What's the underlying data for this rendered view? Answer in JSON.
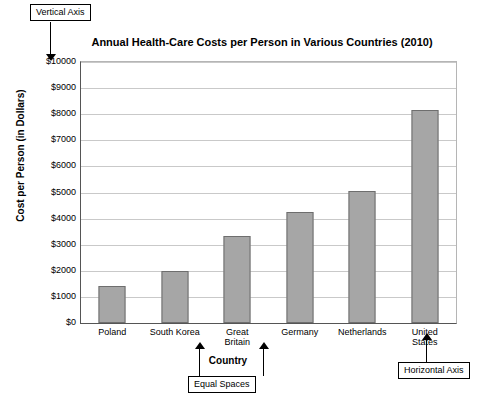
{
  "annotations": {
    "vertical_axis": "Vertical Axis",
    "horizontal_axis": "Horizontal Axis",
    "equal_spaces": "Equal Spaces"
  },
  "chart_data": {
    "type": "bar",
    "title": "Annual Health-Care Costs per Person in Various Countries (2010)",
    "xlabel": "Country",
    "ylabel": "Cost per Person (in Dollars)",
    "categories": [
      "Poland",
      "South Korea",
      "Great Britain",
      "Germany",
      "Netherlands",
      "United States"
    ],
    "category_lines": [
      [
        "Poland"
      ],
      [
        "South Korea"
      ],
      [
        "Great",
        "Britain"
      ],
      [
        "Germany"
      ],
      [
        "Netherlands"
      ],
      [
        "United",
        "States"
      ]
    ],
    "values": [
      1400,
      2000,
      3350,
      4250,
      5050,
      8150
    ],
    "ylim": [
      0,
      10000
    ],
    "yticks": [
      0,
      1000,
      2000,
      3000,
      4000,
      5000,
      6000,
      7000,
      8000,
      9000,
      10000
    ],
    "ytick_labels": [
      "$0",
      "$1000",
      "$2000",
      "$3000",
      "$4000",
      "$5000",
      "$6000",
      "$7000",
      "$8000",
      "$9000",
      "$10000"
    ],
    "grid": true,
    "legend": null,
    "bar_color": "#a6a6a6",
    "bar_border_color": "#6e6e6e"
  }
}
